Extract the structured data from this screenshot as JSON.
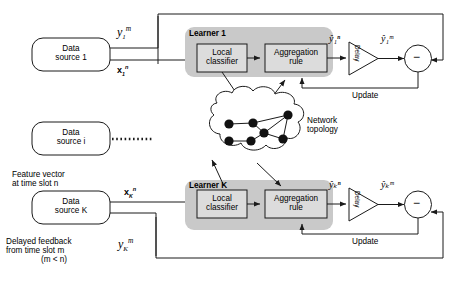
{
  "diagram": {
    "type": "block-diagram",
    "colors": {
      "panel_fill": "#c9c9c9",
      "box_fill": "#dcdcdc",
      "stroke": "#1a1a1a",
      "background": "#ffffff"
    }
  },
  "data_sources": [
    {
      "id": "ds1",
      "line1": "Data",
      "line2": "source 1"
    },
    {
      "id": "dsi",
      "line1": "Data",
      "line2": "source i"
    },
    {
      "id": "dsK",
      "line1": "Data",
      "line2": "source K"
    }
  ],
  "learners": [
    {
      "id": "learner1",
      "title": "Learner 1",
      "local_classifier": {
        "line1": "Local",
        "line2": "classifier"
      },
      "aggregation_rule": {
        "line1": "Aggregation",
        "line2": "rule"
      },
      "delay_label": "Delay",
      "update_label": "Update",
      "pred_in": "ŷ₁ⁿ",
      "pred_out": "ŷ₁ᵐ",
      "sum_sign": "−"
    },
    {
      "id": "learnerK",
      "title": "Learner K",
      "local_classifier": {
        "line1": "Local",
        "line2": "classifier"
      },
      "aggregation_rule": {
        "line1": "Aggregation",
        "line2": "rule"
      },
      "delay_label": "Delay",
      "update_label": "Update",
      "pred_in": "ŷₖⁿ",
      "pred_out": "ŷₖᵐ",
      "sum_sign": "−"
    }
  ],
  "network": {
    "label_line1": "Network",
    "label_line2": "topology",
    "node_count": 7,
    "nodes": [
      {
        "x": 229,
        "y": 124
      },
      {
        "x": 253,
        "y": 123
      },
      {
        "x": 288,
        "y": 115
      },
      {
        "x": 264,
        "y": 133
      },
      {
        "x": 229,
        "y": 141
      },
      {
        "x": 251,
        "y": 141
      },
      {
        "x": 283,
        "y": 139
      }
    ],
    "edges": [
      [
        0,
        1
      ],
      [
        1,
        2
      ],
      [
        1,
        3
      ],
      [
        2,
        3
      ],
      [
        2,
        6
      ],
      [
        3,
        6
      ],
      [
        4,
        5
      ],
      [
        5,
        3
      ]
    ]
  },
  "signals": {
    "y1m": {
      "base": "y",
      "sub": "1",
      "sup": "m"
    },
    "x1n": {
      "base": "x",
      "sub": "1",
      "sup": "n"
    },
    "xKn": {
      "base": "x",
      "sub": "K",
      "sup": "n"
    },
    "yKm": {
      "base": "y",
      "sub": "K",
      "sup": "m"
    }
  },
  "annotations": {
    "feature_vector": {
      "line1": "Feature vector",
      "line2": "at time slot n"
    },
    "delayed_feedback": {
      "line1": "Delayed feedback",
      "line2": "from time slot m",
      "line3": "(m < n)"
    }
  }
}
